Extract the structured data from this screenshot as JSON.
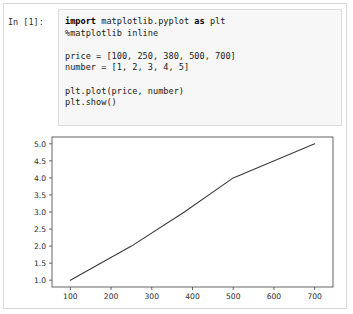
{
  "notebook": {
    "prompt_label": "In [1]:",
    "code_lines": [
      {
        "segments": [
          {
            "text": "import",
            "style": "kw"
          },
          {
            "text": " matplotlib.pyplot ",
            "style": "plain"
          },
          {
            "text": "as",
            "style": "kw"
          },
          {
            "text": " plt",
            "style": "plain"
          }
        ]
      },
      {
        "segments": [
          {
            "text": "%matplotlib inline",
            "style": "magic"
          }
        ]
      },
      {
        "segments": [
          {
            "text": "",
            "style": "plain"
          }
        ]
      },
      {
        "segments": [
          {
            "text": "price = [100, 250, 380, 500, 700]",
            "style": "plain"
          }
        ]
      },
      {
        "segments": [
          {
            "text": "number = [1, 2, 3, 4, 5]",
            "style": "plain"
          }
        ]
      },
      {
        "segments": [
          {
            "text": "",
            "style": "plain"
          }
        ]
      },
      {
        "segments": [
          {
            "text": "plt.plot(price, number)",
            "style": "plain"
          }
        ]
      },
      {
        "segments": [
          {
            "text": "plt.show()",
            "style": "plain"
          }
        ]
      }
    ]
  },
  "chart_data": {
    "type": "line",
    "title": "",
    "xlabel": "",
    "ylabel": "",
    "x": [
      100,
      250,
      380,
      500,
      700
    ],
    "values": [
      1,
      2,
      3,
      4,
      5
    ],
    "series": [
      {
        "name": "number vs price",
        "x": [
          100,
          250,
          380,
          500,
          700
        ],
        "values": [
          1,
          2,
          3,
          4,
          5
        ],
        "color": "#3a3a3a"
      }
    ],
    "xlim": [
      55,
      745
    ],
    "ylim": [
      0.8,
      5.2
    ],
    "xticks": [
      100,
      200,
      300,
      400,
      500,
      600,
      700
    ],
    "xtick_labels": [
      "100",
      "200",
      "300",
      "400",
      "500",
      "600",
      "700"
    ],
    "yticks": [
      1.0,
      1.5,
      2.0,
      2.5,
      3.0,
      3.5,
      4.0,
      4.5,
      5.0
    ],
    "ytick_labels": [
      "1.0",
      "1.5",
      "2.0",
      "2.5",
      "3.0",
      "3.5",
      "4.0",
      "4.5",
      "5.0"
    ],
    "grid": false,
    "legend": false
  }
}
